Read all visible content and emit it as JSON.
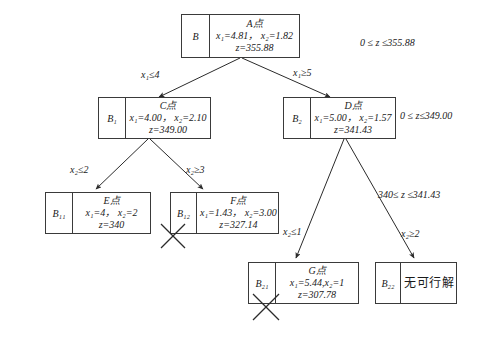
{
  "diagram": {
    "nodes": [
      {
        "id": "root",
        "tag": "B",
        "point": "A点",
        "line1": "x₁=4.81， x₂=1.82",
        "line2": "z=355.88",
        "pruned": false
      },
      {
        "id": "b1",
        "tag": "B₁",
        "point": "C点",
        "line1": "x₁=4.00， x₂=2.10",
        "line2": "z=349.00",
        "pruned": false
      },
      {
        "id": "b2",
        "tag": "B₂",
        "point": "D点",
        "line1": "x₁=5.00， x₂=1.57",
        "line2": "z=341.43",
        "pruned": false
      },
      {
        "id": "b11",
        "tag": "B₁₁",
        "point": "E点",
        "line1": "x₁=4， x₂=2",
        "line2": "z=340",
        "pruned": false
      },
      {
        "id": "b12",
        "tag": "B₁₂",
        "point": "F点",
        "line1": "x₁=1.43， x₂=3.00",
        "line2": "z=327.14",
        "pruned": true
      },
      {
        "id": "b21",
        "tag": "B₂₁",
        "point": "G点",
        "line1": "x₁=5.44,x₂=1",
        "line2": "z=307.78",
        "pruned": true
      },
      {
        "id": "b22",
        "tag": "B₂₂",
        "point": "",
        "line1": "无可行解",
        "line2": "",
        "pruned": false
      }
    ],
    "edge_labels": [
      {
        "id": "root-left",
        "text": "x₁≤4"
      },
      {
        "id": "root-right",
        "text": "x₁≥5"
      },
      {
        "id": "b1-left",
        "text": "x₂≤2"
      },
      {
        "id": "b1-right",
        "text": "x₂≥3"
      },
      {
        "id": "b2-left",
        "text": "x₂≤1"
      },
      {
        "id": "b2-right",
        "text": "x₂≥2"
      }
    ],
    "bounds": [
      {
        "id": "bound-root",
        "text": "0 ≤ z ≤355.88"
      },
      {
        "id": "bound-b2",
        "text": "0 ≤ z≤349.00"
      },
      {
        "id": "bound-b21",
        "text": "340≤ z ≤341.43"
      }
    ]
  }
}
